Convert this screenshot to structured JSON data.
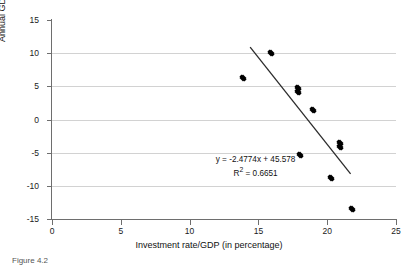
{
  "chart_data": {
    "type": "scatter",
    "title": "",
    "xlabel": "Investment rate/GDP (in percentage)",
    "ylabel": "Annual GDP growth rate",
    "xlim": [
      0,
      25
    ],
    "ylim": [
      -15,
      15
    ],
    "xticks": [
      0,
      5,
      10,
      15,
      20,
      25
    ],
    "yticks": [
      15,
      10,
      5,
      0,
      -5,
      -10,
      -15
    ],
    "xtick_labels": [
      "0",
      "5",
      "10",
      "15",
      "20",
      "25"
    ],
    "ytick_labels": [
      "15",
      "10",
      "5",
      "0",
      "-5",
      "-10",
      "-15"
    ],
    "grid": "horizontal",
    "legend": "none",
    "marker": "filled-diamond",
    "marker_color": "#000000",
    "points": [
      {
        "x": 13.9,
        "y": 6.2
      },
      {
        "x": 15.9,
        "y": 10.0
      },
      {
        "x": 17.9,
        "y": 4.8
      },
      {
        "x": 17.9,
        "y": 4.2
      },
      {
        "x": 19.0,
        "y": 1.5
      },
      {
        "x": 18.0,
        "y": -5.4
      },
      {
        "x": 20.9,
        "y": -3.6
      },
      {
        "x": 20.9,
        "y": -4.1
      },
      {
        "x": 20.3,
        "y": -8.8
      },
      {
        "x": 21.8,
        "y": -13.5
      }
    ],
    "trendline": {
      "color": "#2b2b2b",
      "slope": -2.4774,
      "intercept": 45.578,
      "x_start": 14.4,
      "x_end": 21.7,
      "y_start": 10.9,
      "y_end": -8.2
    },
    "annotations": {
      "equation": "y = -2.4774x + 45.578",
      "r_squared_prefix": "R",
      "r_squared_exponent": "2",
      "r_squared_value": " = 0.6651"
    }
  },
  "caption": {
    "text": "Figure 4.2"
  }
}
